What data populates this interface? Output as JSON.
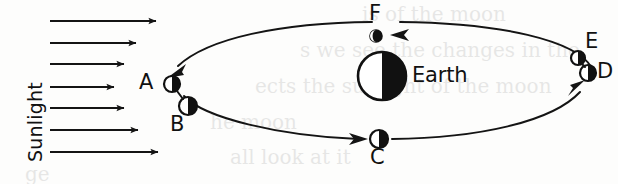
{
  "figure": {
    "type": "moon-phase-orbit-diagram",
    "background_color": "#fdfdfc",
    "ink_color": "#111111"
  },
  "sunlight": {
    "label": "Sunlight",
    "direction": "left-to-right",
    "ray_count": 7,
    "rays": [
      {
        "id": "ray-1",
        "x1": 50,
        "y": 21,
        "x2": 164
      },
      {
        "id": "ray-2",
        "x1": 50,
        "y": 43,
        "x2": 144
      },
      {
        "id": "ray-3",
        "x1": 50,
        "y": 64,
        "x2": 132
      },
      {
        "id": "ray-4",
        "x1": 50,
        "y": 87,
        "x2": 122
      },
      {
        "id": "ray-5",
        "x1": 50,
        "y": 108,
        "x2": 132
      },
      {
        "id": "ray-6",
        "x1": 50,
        "y": 130,
        "x2": 146
      },
      {
        "id": "ray-7",
        "x1": 50,
        "y": 152,
        "x2": 166
      }
    ]
  },
  "earth": {
    "label": "Earth",
    "center_x": 382,
    "center_y": 76,
    "radius": 24,
    "lit_side": "left",
    "dark_side": "right",
    "label_x": 414,
    "label_y": 68
  },
  "orbit": {
    "shape": "ellipse",
    "center_x": 382,
    "center_y": 76,
    "radius_x": 212,
    "radius_y": 54,
    "direction": "counterclockwise",
    "arrowheads": [
      {
        "id": "arrowhead-toward-A",
        "at_position": "upper-left",
        "points": "toward A"
      },
      {
        "id": "arrowhead-toward-F",
        "at_position": "top",
        "points": "leftward toward F"
      },
      {
        "id": "arrowhead-toward-C",
        "at_position": "bottom",
        "points": "rightward toward C"
      },
      {
        "id": "arrowhead-toward-D",
        "at_position": "lower-right",
        "points": "toward D"
      }
    ]
  },
  "moons": [
    {
      "id": "moon-a",
      "label": "A",
      "cx": 172,
      "cy": 84,
      "r": 8,
      "lit_side": "left",
      "label_x": 141,
      "label_y": 75,
      "phase": "half-lit-left"
    },
    {
      "id": "moon-b",
      "label": "B",
      "cx": 188,
      "cy": 106,
      "r": 9,
      "lit_side": "left",
      "label_x": 171,
      "label_y": 118,
      "phase": "half-lit-left"
    },
    {
      "id": "moon-c",
      "label": "C",
      "cx": 379,
      "cy": 139,
      "r": 9,
      "lit_side": "left",
      "label_x": 369,
      "label_y": 150,
      "phase": "half-lit-left"
    },
    {
      "id": "moon-d",
      "label": "D",
      "cx": 588,
      "cy": 73,
      "r": 8,
      "lit_side": "left",
      "label_x": 597,
      "label_y": 63,
      "phase": "half-lit-left"
    },
    {
      "id": "moon-e",
      "label": "E",
      "cx": 578,
      "cy": 58,
      "r": 7,
      "lit_side": "left",
      "label_x": 586,
      "label_y": 34,
      "phase": "half-lit-left"
    },
    {
      "id": "moon-f",
      "label": "F",
      "cx": 376,
      "cy": 36,
      "r": 6,
      "lit_side": "left",
      "label_x": 369,
      "label_y": 5,
      "phase": "nearly-new-thin-left-sliver"
    }
  ],
  "page_bleed_through": [
    {
      "text": "is of the moon",
      "x": 362,
      "y": 8
    },
    {
      "text": "s we see the changes in the",
      "x": 300,
      "y": 45
    },
    {
      "text": "ects the sunlight of the moon",
      "x": 255,
      "y": 82
    },
    {
      "text": "he moon",
      "x": 210,
      "y": 118
    },
    {
      "text": "all look at it",
      "x": 230,
      "y": 152
    },
    {
      "text": "ge",
      "x": 30,
      "y": 170
    }
  ]
}
